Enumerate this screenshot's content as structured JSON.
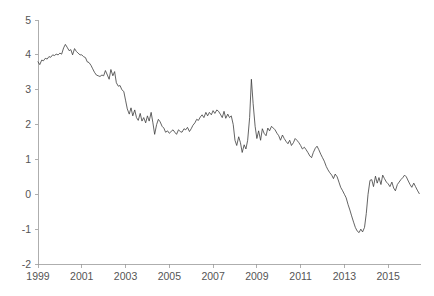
{
  "chart_data": {
    "type": "line",
    "title": "",
    "subtitle": "",
    "xlabel": "",
    "ylabel": "",
    "xlim": [
      1999.0,
      2016.5
    ],
    "ylim": [
      -2,
      5
    ],
    "grid": false,
    "legend": null,
    "line_color": "#3c3c3c",
    "axis_color": "#9a9a9a",
    "tick_label_color": "#555555",
    "xticks": [
      1999,
      2001,
      2003,
      2005,
      2007,
      2009,
      2011,
      2013,
      2015
    ],
    "xtick_labels": [
      "1999",
      "2001",
      "2003",
      "2005",
      "2007",
      "2009",
      "2011",
      "2013",
      "2015"
    ],
    "yticks": [
      -2,
      -1,
      0,
      1,
      2,
      3,
      4,
      5
    ],
    "ytick_labels": [
      "-2",
      "-1",
      "0",
      "1",
      "2",
      "3",
      "4",
      "5"
    ],
    "series": [
      {
        "name": "series-1",
        "x": [
          1999.0,
          1999.08,
          1999.17,
          1999.25,
          1999.33,
          1999.42,
          1999.5,
          1999.58,
          1999.67,
          1999.75,
          1999.83,
          1999.92,
          2000.0,
          2000.08,
          2000.17,
          2000.25,
          2000.33,
          2000.42,
          2000.5,
          2000.58,
          2000.67,
          2000.75,
          2000.83,
          2000.92,
          2001.0,
          2001.08,
          2001.17,
          2001.25,
          2001.33,
          2001.42,
          2001.5,
          2001.58,
          2001.67,
          2001.75,
          2001.83,
          2001.92,
          2002.0,
          2002.08,
          2002.17,
          2002.25,
          2002.33,
          2002.42,
          2002.5,
          2002.58,
          2002.67,
          2002.75,
          2002.83,
          2002.92,
          2003.0,
          2003.08,
          2003.17,
          2003.25,
          2003.33,
          2003.42,
          2003.5,
          2003.58,
          2003.67,
          2003.75,
          2003.83,
          2003.92,
          2004.0,
          2004.08,
          2004.17,
          2004.25,
          2004.33,
          2004.42,
          2004.5,
          2004.58,
          2004.67,
          2004.75,
          2004.83,
          2004.92,
          2005.0,
          2005.08,
          2005.17,
          2005.25,
          2005.33,
          2005.42,
          2005.5,
          2005.58,
          2005.67,
          2005.75,
          2005.83,
          2005.92,
          2006.0,
          2006.08,
          2006.17,
          2006.25,
          2006.33,
          2006.42,
          2006.5,
          2006.58,
          2006.67,
          2006.75,
          2006.83,
          2006.92,
          2007.0,
          2007.08,
          2007.17,
          2007.25,
          2007.33,
          2007.42,
          2007.5,
          2007.58,
          2007.67,
          2007.75,
          2007.83,
          2007.92,
          2008.0,
          2008.08,
          2008.17,
          2008.25,
          2008.33,
          2008.42,
          2008.5,
          2008.58,
          2008.67,
          2008.75,
          2008.83,
          2008.92,
          2009.0,
          2009.08,
          2009.17,
          2009.25,
          2009.33,
          2009.42,
          2009.5,
          2009.58,
          2009.67,
          2009.75,
          2009.83,
          2009.92,
          2010.0,
          2010.08,
          2010.17,
          2010.25,
          2010.33,
          2010.42,
          2010.5,
          2010.58,
          2010.67,
          2010.75,
          2010.83,
          2010.92,
          2011.0,
          2011.08,
          2011.17,
          2011.25,
          2011.33,
          2011.42,
          2011.5,
          2011.58,
          2011.67,
          2011.75,
          2011.83,
          2011.92,
          2012.0,
          2012.08,
          2012.17,
          2012.25,
          2012.33,
          2012.42,
          2012.5,
          2012.58,
          2012.67,
          2012.75,
          2012.83,
          2012.92,
          2013.0,
          2013.08,
          2013.17,
          2013.25,
          2013.33,
          2013.42,
          2013.5,
          2013.58,
          2013.67,
          2013.75,
          2013.83,
          2013.92,
          2014.0,
          2014.08,
          2014.17,
          2014.25,
          2014.33,
          2014.42,
          2014.5,
          2014.58,
          2014.67,
          2014.75,
          2014.83,
          2014.92,
          2015.0,
          2015.08,
          2015.17,
          2015.25,
          2015.33,
          2015.42,
          2015.5,
          2015.58,
          2015.67,
          2015.75,
          2015.83,
          2015.92,
          2016.0,
          2016.08,
          2016.17,
          2016.25,
          2016.33,
          2016.42
        ],
        "y": [
          3.8,
          3.72,
          3.85,
          3.83,
          3.9,
          3.88,
          3.95,
          3.93,
          4.0,
          3.98,
          4.02,
          4.0,
          4.05,
          4.02,
          4.2,
          4.3,
          4.22,
          4.12,
          4.15,
          4.0,
          4.18,
          4.1,
          4.05,
          4.0,
          4.0,
          3.95,
          3.92,
          3.8,
          3.78,
          3.7,
          3.6,
          3.5,
          3.42,
          3.4,
          3.38,
          3.42,
          3.4,
          3.55,
          3.42,
          3.3,
          3.58,
          3.4,
          3.52,
          3.2,
          3.1,
          3.12,
          3.0,
          2.95,
          2.7,
          2.45,
          2.3,
          2.48,
          2.25,
          2.42,
          2.2,
          2.12,
          2.32,
          2.1,
          2.2,
          2.05,
          2.25,
          2.1,
          2.35,
          2.05,
          1.72,
          2.0,
          2.15,
          2.08,
          1.95,
          1.9,
          1.78,
          1.82,
          1.75,
          1.8,
          1.85,
          1.78,
          1.72,
          1.85,
          1.8,
          1.78,
          1.88,
          1.85,
          1.92,
          1.8,
          1.88,
          1.98,
          2.05,
          2.15,
          2.12,
          2.22,
          2.28,
          2.2,
          2.35,
          2.25,
          2.35,
          2.28,
          2.4,
          2.32,
          2.42,
          2.38,
          2.3,
          2.2,
          2.38,
          2.18,
          2.3,
          2.2,
          2.25,
          2.0,
          1.55,
          1.4,
          1.65,
          1.48,
          1.2,
          1.42,
          1.3,
          1.55,
          2.2,
          3.3,
          2.6,
          1.95,
          1.6,
          1.82,
          1.55,
          1.88,
          1.75,
          1.68,
          1.9,
          1.82,
          1.95,
          1.9,
          1.85,
          1.75,
          1.68,
          1.55,
          1.7,
          1.6,
          1.52,
          1.45,
          1.55,
          1.4,
          1.48,
          1.6,
          1.55,
          1.48,
          1.4,
          1.3,
          1.35,
          1.28,
          1.2,
          1.1,
          1.05,
          1.2,
          1.32,
          1.38,
          1.28,
          1.15,
          1.05,
          0.95,
          0.8,
          0.7,
          0.62,
          0.55,
          0.45,
          0.58,
          0.5,
          0.35,
          0.2,
          0.1,
          0.0,
          -0.1,
          -0.3,
          -0.45,
          -0.62,
          -0.8,
          -0.95,
          -1.05,
          -1.1,
          -1.0,
          -1.08,
          -0.95,
          -0.55,
          0.0,
          0.4,
          0.42,
          0.22,
          0.52,
          0.32,
          0.48,
          0.28,
          0.55,
          0.45,
          0.35,
          0.3,
          0.22,
          0.35,
          0.18,
          0.1,
          0.28,
          0.35,
          0.42,
          0.48,
          0.55,
          0.5,
          0.38,
          0.28,
          0.2,
          0.32,
          0.22,
          0.12,
          0.02
        ]
      }
    ]
  }
}
